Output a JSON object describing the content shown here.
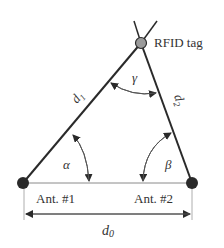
{
  "diagram": {
    "nodes": {
      "tag": {
        "label": "RFID tag",
        "x": 141,
        "y": 43,
        "fill": "#9a9a9a"
      },
      "ant1": {
        "label": "Ant. #1",
        "x": 23,
        "y": 183,
        "fill": "#2a2a2a"
      },
      "ant2": {
        "label": "Ant. #2",
        "x": 192,
        "y": 183,
        "fill": "#2a2a2a"
      }
    },
    "edges": {
      "d1": {
        "label": "d",
        "sub": "1"
      },
      "d2": {
        "label": "d",
        "sub": "2"
      },
      "d0": {
        "label": "d",
        "sub": "0"
      }
    },
    "angles": {
      "alpha": "α",
      "beta": "β",
      "gamma": "γ"
    },
    "colors": {
      "line": "#2a2a2a",
      "thin_line": "#777777",
      "text": "#333333"
    }
  }
}
